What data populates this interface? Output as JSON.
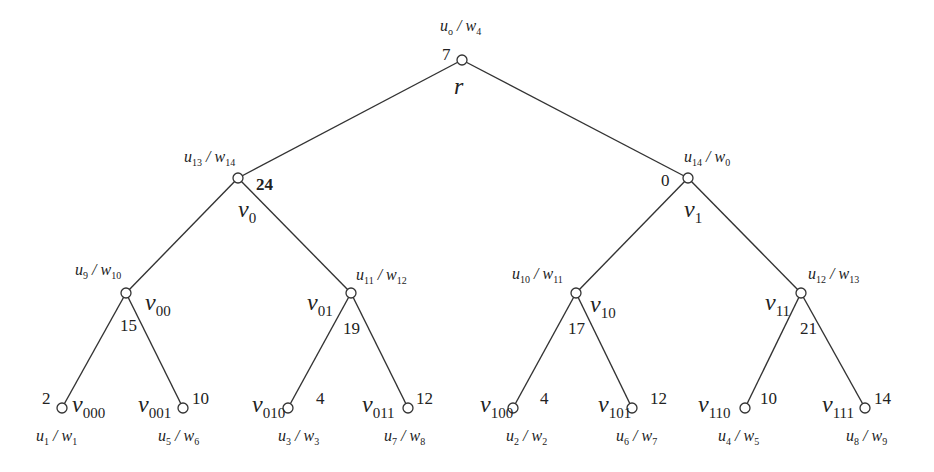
{
  "diagram": {
    "type": "binary-tree",
    "nodes": [
      {
        "id": "r",
        "name": "r",
        "sub": "",
        "weight": "7",
        "uw": {
          "u": "o",
          "w": "4"
        }
      },
      {
        "id": "v0",
        "name": "v",
        "sub": "0",
        "weight": "24",
        "uw": {
          "u": "13",
          "w": "14"
        }
      },
      {
        "id": "v1",
        "name": "v",
        "sub": "1",
        "weight": "0",
        "uw": {
          "u": "14",
          "w": "0"
        }
      },
      {
        "id": "v00",
        "name": "v",
        "sub": "00",
        "weight": "15",
        "uw": {
          "u": "9",
          "w": "10"
        }
      },
      {
        "id": "v01",
        "name": "v",
        "sub": "01",
        "weight": "19",
        "uw": {
          "u": "11",
          "w": "12"
        }
      },
      {
        "id": "v10",
        "name": "v",
        "sub": "10",
        "weight": "17",
        "uw": {
          "u": "10",
          "w": "11"
        }
      },
      {
        "id": "v11",
        "name": "v",
        "sub": "11",
        "weight": "21",
        "uw": {
          "u": "12",
          "w": "13"
        }
      },
      {
        "id": "v000",
        "name": "v",
        "sub": "000",
        "weight": "2",
        "uw": {
          "u": "1",
          "w": "1"
        }
      },
      {
        "id": "v001",
        "name": "v",
        "sub": "001",
        "weight": "10",
        "uw": {
          "u": "5",
          "w": "6"
        }
      },
      {
        "id": "v010",
        "name": "v",
        "sub": "010",
        "weight": "4",
        "uw": {
          "u": "3",
          "w": "3"
        }
      },
      {
        "id": "v011",
        "name": "v",
        "sub": "011",
        "weight": "12",
        "uw": {
          "u": "7",
          "w": "8"
        }
      },
      {
        "id": "v100",
        "name": "v",
        "sub": "100",
        "weight": "4",
        "uw": {
          "u": "2",
          "w": "2"
        }
      },
      {
        "id": "v101",
        "name": "v",
        "sub": "101",
        "weight": "12",
        "uw": {
          "u": "6",
          "w": "7"
        }
      },
      {
        "id": "v110",
        "name": "v",
        "sub": "110",
        "weight": "10",
        "uw": {
          "u": "4",
          "w": "5"
        }
      },
      {
        "id": "v111",
        "name": "v",
        "sub": "111",
        "weight": "14",
        "uw": {
          "u": "8",
          "w": "9"
        }
      }
    ],
    "edges": [
      [
        "r",
        "v0"
      ],
      [
        "r",
        "v1"
      ],
      [
        "v0",
        "v00"
      ],
      [
        "v0",
        "v01"
      ],
      [
        "v1",
        "v10"
      ],
      [
        "v1",
        "v11"
      ],
      [
        "v00",
        "v000"
      ],
      [
        "v00",
        "v001"
      ],
      [
        "v01",
        "v010"
      ],
      [
        "v01",
        "v011"
      ],
      [
        "v10",
        "v100"
      ],
      [
        "v10",
        "v101"
      ],
      [
        "v11",
        "v110"
      ],
      [
        "v11",
        "v111"
      ]
    ],
    "root_label": "r",
    "u_symbol": "u",
    "w_symbol": "w",
    "separator": " / "
  }
}
